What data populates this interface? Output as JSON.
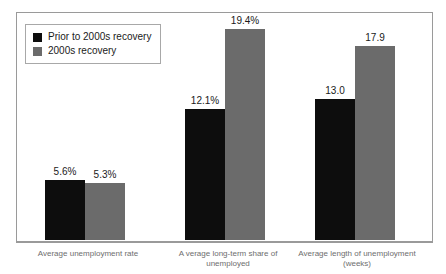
{
  "title_remnant": "",
  "colors": {
    "series_a": "#0d0d0d",
    "series_b": "#6b6b6b",
    "frame": "#9a9a9a",
    "label_text": "#6e6e6e",
    "value_text": "#1a1a1a"
  },
  "legend": {
    "entries": [
      {
        "label": "Prior to 2000s recovery",
        "swatch": "#0d0d0d",
        "icon": "legend-square-black"
      },
      {
        "label": "2000s recovery",
        "swatch": "#6b6b6b",
        "icon": "legend-square-gray"
      }
    ]
  },
  "chart_data": {
    "type": "bar",
    "title": "",
    "subtitle": "",
    "xlabel": "",
    "ylabel": "",
    "grid": false,
    "legend_position": "top-left",
    "ylim": [
      0,
      21
    ],
    "categories": [
      "Average unemployment rate",
      "A verage long-term share of\nunemployed",
      "Average length of unemployment\n(weeks)"
    ],
    "series": [
      {
        "name": "Prior to 2000s recovery",
        "color": "#0d0d0d",
        "values": [
          5.6,
          12.1,
          13.0
        ],
        "labels": [
          "5.6%",
          "12.1%",
          "13.0"
        ]
      },
      {
        "name": "2000s recovery",
        "color": "#6b6b6b",
        "values": [
          5.3,
          19.4,
          17.9
        ],
        "labels": [
          "5.3%",
          "19.4%",
          "17.9"
        ]
      }
    ]
  },
  "geometry": {
    "groups": [
      {
        "left": 28,
        "label_left": 8,
        "label_width": 160
      },
      {
        "left": 168,
        "label_left": 148,
        "label_width": 160
      },
      {
        "left": 298,
        "label_left": 272,
        "label_width": 170
      }
    ],
    "bar_width": 40,
    "bar_gap": 0,
    "plot_height": 229,
    "value_max": 21
  }
}
